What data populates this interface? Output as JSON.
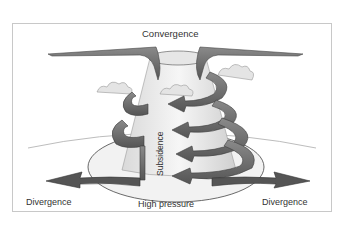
{
  "diagram": {
    "labels": {
      "top": "Convergence",
      "center_vertical": "Subsidence",
      "bottom_center": "High pressure",
      "bottom_left": "Divergence",
      "bottom_right": "Divergence"
    },
    "colors": {
      "arrow_fill": "#6f6f6f",
      "arrow_dark": "#4a4a4a",
      "column_fill": "#e8e8e8",
      "frame_border": "#c8c8c8",
      "text": "#333333"
    }
  }
}
